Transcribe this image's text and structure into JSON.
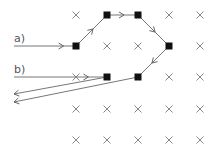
{
  "diagram": {
    "labels": [
      {
        "id": "a",
        "text": "a)",
        "x": 14,
        "y": 42
      },
      {
        "id": "b",
        "text": "b)",
        "x": 14,
        "y": 73
      }
    ],
    "grid": {
      "columns": [
        76,
        107,
        138,
        169,
        200
      ],
      "rows": [
        15,
        46,
        77,
        109,
        140
      ],
      "marker": "x"
    },
    "nodes": [
      {
        "id": "n1",
        "x": 76,
        "y": 46
      },
      {
        "id": "n2",
        "x": 107,
        "y": 15
      },
      {
        "id": "n3",
        "x": 138,
        "y": 15
      },
      {
        "id": "n4",
        "x": 169,
        "y": 46
      },
      {
        "id": "n5",
        "x": 138,
        "y": 77
      },
      {
        "id": "n6",
        "x": 107,
        "y": 77
      }
    ],
    "paths": [
      {
        "id": "path-a",
        "label": "a)",
        "points": [
          [
            14,
            46
          ],
          [
            76,
            46
          ],
          [
            107,
            15
          ],
          [
            138,
            15
          ],
          [
            169,
            46
          ],
          [
            138,
            77
          ],
          [
            14,
            102
          ]
        ]
      },
      {
        "id": "path-b",
        "label": "b)",
        "points": [
          [
            14,
            77
          ],
          [
            107,
            77
          ],
          [
            14,
            94
          ]
        ]
      }
    ]
  }
}
